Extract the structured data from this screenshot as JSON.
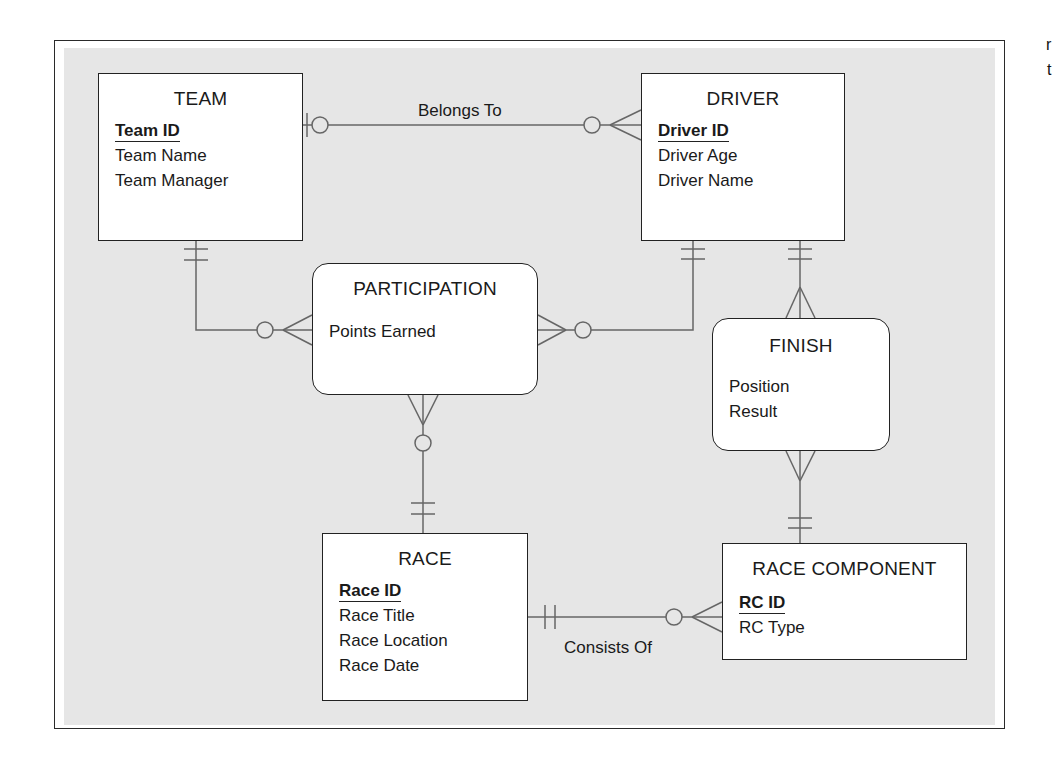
{
  "diagram": {
    "type": "entity-relationship",
    "notation": "crow's foot",
    "entities": [
      {
        "id": "team",
        "name": "TEAM",
        "shape": "rectangle",
        "attributes": [
          {
            "name": "Team ID",
            "key": true
          },
          {
            "name": "Team Name",
            "key": false
          },
          {
            "name": "Team Manager",
            "key": false
          }
        ]
      },
      {
        "id": "driver",
        "name": "DRIVER",
        "shape": "rectangle",
        "attributes": [
          {
            "name": "Driver ID",
            "key": true
          },
          {
            "name": "Driver Age",
            "key": false
          },
          {
            "name": "Driver Name",
            "key": false
          }
        ]
      },
      {
        "id": "participation",
        "name": "PARTICIPATION",
        "shape": "rounded",
        "attributes": [
          {
            "name": "Points Earned",
            "key": false
          }
        ]
      },
      {
        "id": "finish",
        "name": "FINISH",
        "shape": "rounded",
        "attributes": [
          {
            "name": "Position",
            "key": false
          },
          {
            "name": "Result",
            "key": false
          }
        ]
      },
      {
        "id": "race",
        "name": "RACE",
        "shape": "rectangle",
        "attributes": [
          {
            "name": "Race ID",
            "key": true
          },
          {
            "name": "Race Title",
            "key": false
          },
          {
            "name": "Race Location",
            "key": false
          },
          {
            "name": "Race Date",
            "key": false
          }
        ]
      },
      {
        "id": "race_component",
        "name": "RACE COMPONENT",
        "shape": "rectangle",
        "attributes": [
          {
            "name": "RC ID",
            "key": true
          },
          {
            "name": "RC Type",
            "key": false
          }
        ]
      }
    ],
    "relationships": [
      {
        "from": "team",
        "to": "driver",
        "label": "Belongs To",
        "from_cardinality": "zero-or-one",
        "to_cardinality": "zero-or-many"
      },
      {
        "from": "team",
        "to": "participation",
        "label": "",
        "from_cardinality": "exactly-one",
        "to_cardinality": "zero-or-many"
      },
      {
        "from": "driver",
        "to": "participation",
        "label": "",
        "from_cardinality": "exactly-one",
        "to_cardinality": "zero-or-many"
      },
      {
        "from": "race",
        "to": "participation",
        "label": "",
        "from_cardinality": "exactly-one",
        "to_cardinality": "zero-or-many"
      },
      {
        "from": "driver",
        "to": "finish",
        "label": "",
        "from_cardinality": "exactly-one",
        "to_cardinality": "one-or-many"
      },
      {
        "from": "race_component",
        "to": "finish",
        "label": "",
        "from_cardinality": "exactly-one",
        "to_cardinality": "one-or-many"
      },
      {
        "from": "race",
        "to": "race_component",
        "label": "Consists Of",
        "from_cardinality": "exactly-one",
        "to_cardinality": "zero-or-many"
      }
    ],
    "labels": {
      "belongs_to": "Belongs To",
      "consists_of": "Consists Of"
    },
    "edge_fragments": [
      "r",
      "t"
    ],
    "colors": {
      "canvas_bg": "#e6e6e6",
      "entity_bg": "#ffffff",
      "border": "#222222",
      "connector": "#666666"
    }
  }
}
